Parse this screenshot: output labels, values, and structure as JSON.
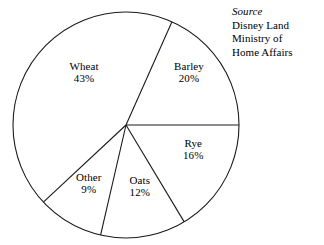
{
  "chart_data": {
    "type": "pie",
    "title": "",
    "subtitle": "",
    "xlabel": "",
    "ylabel": "",
    "grid": false,
    "legend_position": "none",
    "label_format": "name + percent inside slice",
    "units": "percent",
    "total": 100,
    "categories": [
      "Wheat",
      "Barley",
      "Rye",
      "Oats",
      "Other"
    ],
    "values": [
      43,
      20,
      16,
      12,
      9
    ],
    "slices": [
      {
        "name": "Wheat",
        "value": 43,
        "value_label": "43%",
        "start_angle_deg": 227,
        "end_angle_deg": 384,
        "sweep_deg": 157,
        "color": "#ffffff",
        "label_x": 84,
        "label_y": 72
      },
      {
        "name": "Barley",
        "value": 20,
        "value_label": "20%",
        "start_angle_deg": 24,
        "end_angle_deg": 90,
        "sweep_deg": 66,
        "color": "#ffffff",
        "label_x": 189,
        "label_y": 72
      },
      {
        "name": "Rye",
        "value": 16,
        "value_label": "16%",
        "start_angle_deg": 90,
        "end_angle_deg": 149,
        "sweep_deg": 59,
        "color": "#ffffff",
        "label_x": 193,
        "label_y": 149
      },
      {
        "name": "Oats",
        "value": 12,
        "value_label": "12%",
        "start_angle_deg": 149,
        "end_angle_deg": 193,
        "sweep_deg": 44,
        "color": "#ffffff",
        "label_x": 140,
        "label_y": 186
      },
      {
        "name": "Other",
        "value": 9,
        "value_label": "9%",
        "start_angle_deg": 193,
        "end_angle_deg": 227,
        "sweep_deg": 34,
        "color": "#ffffff",
        "label_x": 89,
        "label_y": 183
      }
    ],
    "geometry": {
      "center_x": 126,
      "center_y": 125,
      "radius": 113,
      "stroke_color": "#1a1a1a",
      "fill_color": "#ffffff",
      "background": "#ffffff"
    }
  },
  "source": {
    "title": "Source",
    "lines": [
      "Disney Land",
      "Ministry of",
      "Home Affairs"
    ]
  }
}
